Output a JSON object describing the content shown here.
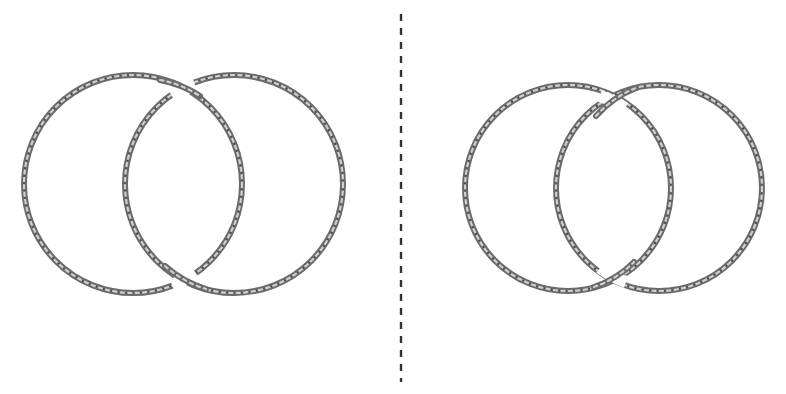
{
  "figure": {
    "colors": {
      "background": "#ffffff",
      "rope": "#6a6a6a",
      "rope_highlight": "#cfcfcf",
      "divider": "#333333"
    },
    "divider": {
      "x": 401,
      "y_start": 14,
      "y_end": 382,
      "style": "dashed"
    },
    "panels": [
      {
        "name": "left-link",
        "rings": [
          {
            "name": "ring-a",
            "cx": 133,
            "cy": 184,
            "r": 109
          },
          {
            "name": "ring-b",
            "cx": 234,
            "cy": 184,
            "r": 109
          }
        ],
        "crossings": [
          {
            "position": "top",
            "over": "ring-a",
            "under": "ring-b"
          },
          {
            "position": "bottom",
            "over": "ring-b",
            "under": "ring-a"
          }
        ]
      },
      {
        "name": "right-link",
        "rings": [
          {
            "name": "ring-a",
            "cx": 568,
            "cy": 188,
            "r": 103
          },
          {
            "name": "ring-b",
            "cx": 659,
            "cy": 188,
            "r": 103
          }
        ],
        "crossings": [
          {
            "position": "top",
            "over": "ring-b",
            "under": "ring-a"
          },
          {
            "position": "bottom",
            "over": "ring-a",
            "under": "ring-b"
          }
        ]
      }
    ]
  }
}
